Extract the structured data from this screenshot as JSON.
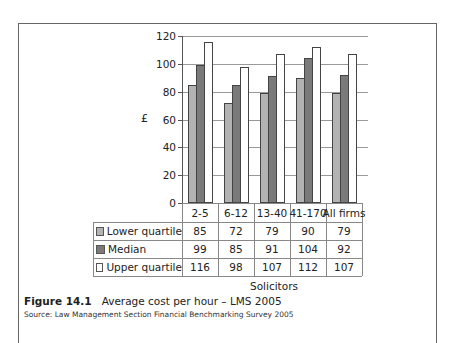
{
  "figure": {
    "label": "Figure 14.1",
    "title": "Average cost per hour – LMS 2005",
    "source": "Source: Law Management Section Financial Benchmarking Survey 2005"
  },
  "colors": {
    "lower_quartile": "#b3b3b3",
    "median": "#7a7a7a",
    "upper_quartile": "#ffffff",
    "frame": "#666666",
    "grid": "#999999"
  },
  "chart_data": {
    "type": "bar",
    "title": "Average cost per hour – LMS 2005",
    "xlabel": "Solicitors",
    "ylabel": "£",
    "ylim": [
      0,
      120
    ],
    "yticks": [
      0,
      20,
      40,
      60,
      80,
      100,
      120
    ],
    "grid": true,
    "legend_position": "data-table-left",
    "categories": [
      "2-5",
      "6-12",
      "13-40",
      "41-170",
      "All firms"
    ],
    "series": [
      {
        "name": "Lower quartile",
        "values": [
          85,
          72,
          79,
          90,
          79
        ]
      },
      {
        "name": "Median",
        "values": [
          99,
          85,
          91,
          104,
          92
        ]
      },
      {
        "name": "Upper quartile",
        "values": [
          116,
          98,
          107,
          112,
          107
        ]
      }
    ]
  }
}
